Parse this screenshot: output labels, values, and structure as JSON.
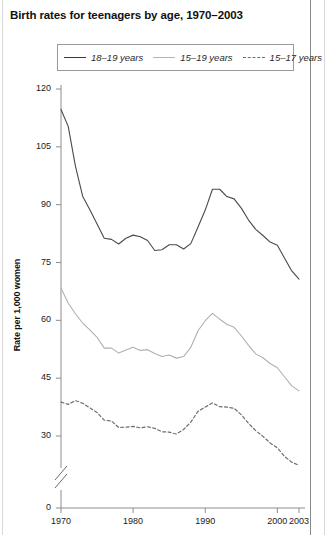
{
  "chart_data": {
    "type": "line",
    "title": "Birth rates for teenagers by age, 1970–2003",
    "xlabel": "",
    "ylabel": "Rate per 1,000 women",
    "xlim": [
      1970,
      2003
    ],
    "ylim": [
      28,
      123
    ],
    "y_axis_break": true,
    "y_axis_break_note": "axis broken between 0 and 30",
    "grid": false,
    "legend_position": "top-center",
    "yticks": [
      0,
      30,
      45,
      60,
      75,
      90,
      105,
      120
    ],
    "ytick_labels": [
      "0",
      "30",
      "45",
      "60",
      "75",
      "90",
      "105",
      "120"
    ],
    "xticks": [
      1970,
      1980,
      1990,
      2000,
      2003
    ],
    "xtick_labels": [
      "1970",
      "1980",
      "1990",
      "2000",
      "2003"
    ],
    "x": [
      1970,
      1971,
      1972,
      1973,
      1974,
      1975,
      1976,
      1977,
      1978,
      1979,
      1980,
      1981,
      1982,
      1983,
      1984,
      1985,
      1986,
      1987,
      1988,
      1989,
      1990,
      1991,
      1992,
      1993,
      1994,
      1995,
      1996,
      1997,
      1998,
      1999,
      2000,
      2001,
      2002,
      2003
    ],
    "series": [
      {
        "name": "18–19 years",
        "style": "solid",
        "color": "#4a4a4a",
        "values": [
          114.7,
          110.3,
          100.0,
          92.2,
          88.7,
          85.0,
          81.3,
          81.0,
          79.8,
          81.3,
          82.1,
          81.7,
          80.7,
          78.1,
          78.3,
          79.6,
          79.6,
          78.5,
          79.9,
          84.2,
          88.6,
          94.0,
          94.0,
          92.1,
          91.5,
          89.1,
          86.0,
          83.6,
          82.0,
          80.3,
          79.5,
          76.1,
          72.8,
          70.7
        ]
      },
      {
        "name": "15–19 years",
        "style": "solid",
        "color": "#b0b0b0",
        "values": [
          68.3,
          64.5,
          61.7,
          59.3,
          57.5,
          55.6,
          52.8,
          52.8,
          51.5,
          52.3,
          53.0,
          52.2,
          52.4,
          51.4,
          50.6,
          51.0,
          50.2,
          50.6,
          53.0,
          57.3,
          59.9,
          61.8,
          60.3,
          59.0,
          58.2,
          56.0,
          53.5,
          51.3,
          50.3,
          48.8,
          47.7,
          45.3,
          43.0,
          41.7
        ]
      },
      {
        "name": "15–17 years",
        "style": "dashed",
        "color": "#6e6e6e",
        "values": [
          38.8,
          38.2,
          39.2,
          38.5,
          37.3,
          36.1,
          34.1,
          33.9,
          32.2,
          32.3,
          32.5,
          32.1,
          32.4,
          32.0,
          31.1,
          31.0,
          30.5,
          31.7,
          33.6,
          36.4,
          37.5,
          38.6,
          37.6,
          37.5,
          37.2,
          35.5,
          33.3,
          31.4,
          29.9,
          28.2,
          26.9,
          24.7,
          23.2,
          22.4
        ]
      }
    ]
  },
  "legend": {
    "items": [
      {
        "label": "18–19 years",
        "icon": "solid-dark-line-icon"
      },
      {
        "label": "15–19 years",
        "icon": "solid-light-line-icon"
      },
      {
        "label": "15–17 years",
        "icon": "dashed-line-icon"
      }
    ]
  }
}
